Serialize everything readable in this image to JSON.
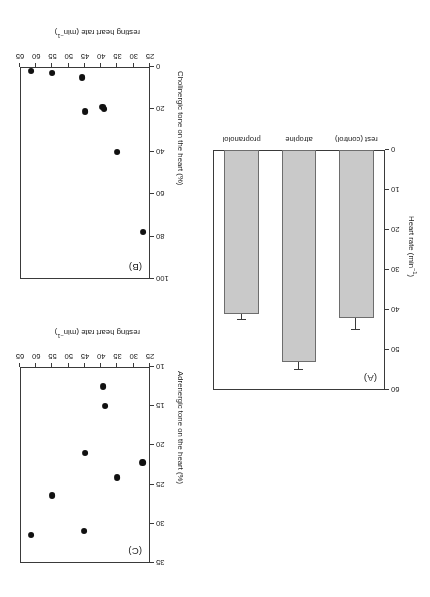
{
  "figure": {
    "orientation_deg": 180,
    "panels": [
      "A",
      "B",
      "C"
    ],
    "background": "#ffffff",
    "bar_fill": "#c9c9c9",
    "bar_stroke": "#6d6d6d",
    "dot_color": "#111111",
    "axis_color": "#3a3a3a"
  },
  "panelA": {
    "label": "(A)",
    "ylabel_main": "Heart rate (min",
    "ylabel_sup": "−1",
    "ylabel_tail": ")",
    "yticks": [
      "0",
      "10",
      "20",
      "30",
      "40",
      "50",
      "60"
    ],
    "ylim": [
      0,
      60
    ],
    "categories": [
      "rest (control)",
      "atropine",
      "propranolol"
    ],
    "values": [
      42,
      53,
      41
    ],
    "errors": [
      3.0,
      2.0,
      1.6
    ]
  },
  "panelB": {
    "label": "(B)",
    "ylabel_text": "Cholinergic tone on the heart (%)",
    "xlabel_main": "resting heart rate (min",
    "xlabel_sup": "−1",
    "xlabel_tail": ")",
    "yticks": [
      "0",
      "20",
      "40",
      "60",
      "80",
      "100"
    ],
    "xticks": [
      "25",
      "30",
      "35",
      "40",
      "45",
      "50",
      "55",
      "60",
      "65"
    ],
    "ylim": [
      0,
      100
    ],
    "xlim": [
      25,
      65
    ],
    "points": [
      {
        "x": 27.2,
        "y": 78
      },
      {
        "x": 35.1,
        "y": 40
      },
      {
        "x": 39.0,
        "y": 20
      },
      {
        "x": 39.6,
        "y": 19
      },
      {
        "x": 45.0,
        "y": 21
      },
      {
        "x": 46.0,
        "y": 5
      },
      {
        "x": 55.0,
        "y": 3
      },
      {
        "x": 61.5,
        "y": 2
      }
    ]
  },
  "panelC": {
    "label": "(C)",
    "ylabel_text": "Adrenergic tone on the heart (%)",
    "xlabel_main": "resting heart rate (min",
    "xlabel_sup": "−1",
    "xlabel_tail": ")",
    "yticks": [
      "10",
      "15",
      "20",
      "25",
      "30",
      "35"
    ],
    "xticks": [
      "25",
      "30",
      "35",
      "40",
      "45",
      "50",
      "55",
      "60",
      "65"
    ],
    "ylim": [
      10,
      35
    ],
    "xlim": [
      25,
      65
    ],
    "points": [
      {
        "x": 27.3,
        "y": 22.2
      },
      {
        "x": 35.0,
        "y": 24.1
      },
      {
        "x": 38.8,
        "y": 15.0
      },
      {
        "x": 39.5,
        "y": 12.5
      },
      {
        "x": 45.0,
        "y": 21.0
      },
      {
        "x": 45.4,
        "y": 30.9
      },
      {
        "x": 55.0,
        "y": 26.4
      },
      {
        "x": 61.6,
        "y": 31.4
      }
    ]
  },
  "chart_data": [
    {
      "type": "bar",
      "panel": "A",
      "title": "(A)",
      "categories": [
        "rest (control)",
        "atropine",
        "propranolol"
      ],
      "values": [
        42,
        53,
        41
      ],
      "errors": [
        3.0,
        2.0,
        1.6
      ],
      "xlabel": "",
      "ylabel": "Heart rate (min−1)",
      "ylim": [
        0,
        60
      ],
      "yticks": [
        0,
        10,
        20,
        30,
        40,
        50,
        60
      ],
      "grid": false,
      "legend": "none"
    },
    {
      "type": "scatter",
      "panel": "B",
      "title": "(B)",
      "x": [
        27.2,
        35.1,
        39.0,
        39.6,
        45.0,
        46.0,
        55.0,
        61.5
      ],
      "y": [
        78,
        40,
        20,
        19,
        21,
        5,
        3,
        2
      ],
      "xlabel": "resting heart rate (min−1)",
      "ylabel": "Cholinergic tone on the heart (%)",
      "xlim": [
        25,
        65
      ],
      "ylim": [
        0,
        100
      ],
      "xticks": [
        25,
        30,
        35,
        40,
        45,
        50,
        55,
        60,
        65
      ],
      "yticks": [
        0,
        20,
        40,
        60,
        80,
        100
      ],
      "grid": false,
      "legend": "none"
    },
    {
      "type": "scatter",
      "panel": "C",
      "title": "(C)",
      "x": [
        27.3,
        35.0,
        38.8,
        39.5,
        45.0,
        45.4,
        55.0,
        61.6
      ],
      "y": [
        22.2,
        24.1,
        15.0,
        12.5,
        21.0,
        30.9,
        26.4,
        31.4
      ],
      "xlabel": "resting heart rate (min−1)",
      "ylabel": "Adrenergic tone on the heart (%)",
      "xlim": [
        25,
        65
      ],
      "ylim": [
        10,
        35
      ],
      "xticks": [
        25,
        30,
        35,
        40,
        45,
        50,
        55,
        60,
        65
      ],
      "yticks": [
        10,
        15,
        20,
        25,
        30,
        35
      ],
      "grid": false,
      "legend": "none"
    }
  ]
}
